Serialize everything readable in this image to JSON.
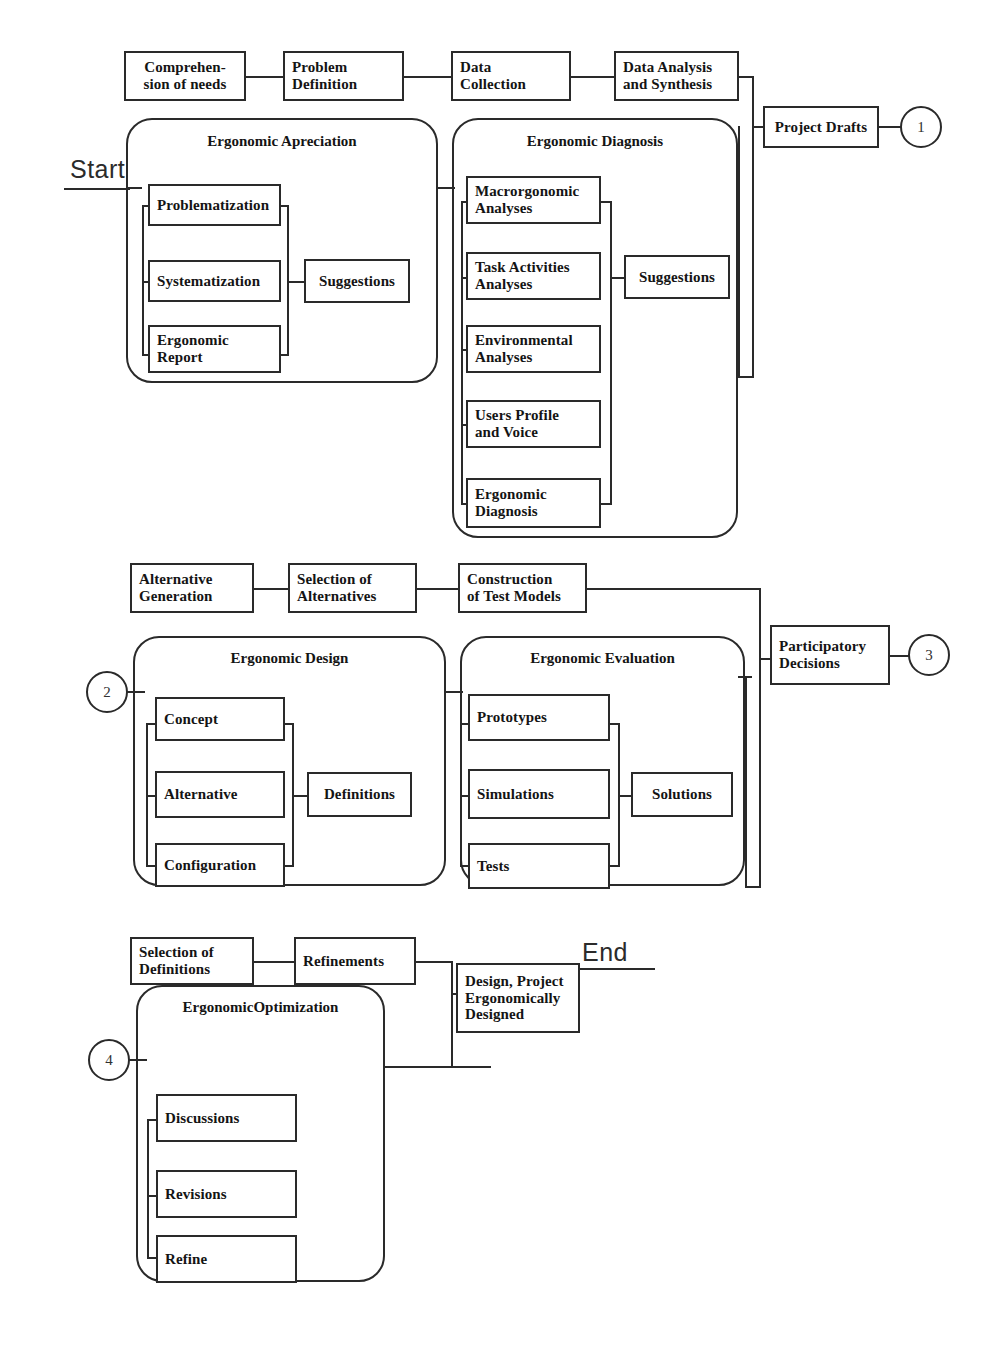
{
  "diagram": {
    "endpoints": {
      "start": "Start",
      "end": "End"
    },
    "connector_nodes": [
      {
        "id": "c1",
        "label": "1"
      },
      {
        "id": "c2",
        "label": "2"
      },
      {
        "id": "c3",
        "label": "3"
      },
      {
        "id": "c4",
        "label": "4"
      }
    ],
    "phase1": {
      "steps": [
        {
          "label": "Comprehen-\nsion of needs"
        },
        {
          "label": "Problem\nDefinition"
        },
        {
          "label": "Data\nCollection"
        },
        {
          "label": "Data Analysis\nand Synthesis"
        }
      ],
      "output": {
        "label": "Project Drafts"
      },
      "panels": [
        {
          "title": "Ergonomic Apreciation",
          "items": [
            {
              "label": "Problematization"
            },
            {
              "label": "Systematization"
            },
            {
              "label": "Ergonomic\nReport"
            }
          ],
          "result": {
            "label": "Suggestions"
          }
        },
        {
          "title": "Ergonomic Diagnosis",
          "items": [
            {
              "label": "Macrorgonomic\nAnalyses"
            },
            {
              "label": "Task Activities\nAnalyses"
            },
            {
              "label": "Environmental\nAnalyses"
            },
            {
              "label": "Users Profile\nand Voice"
            },
            {
              "label": "Ergonomic\nDiagnosis"
            }
          ],
          "result": {
            "label": "Suggestions"
          }
        }
      ]
    },
    "phase2": {
      "steps": [
        {
          "label": "Alternative\nGeneration"
        },
        {
          "label": "Selection of\nAlternatives"
        },
        {
          "label": "Construction\nof Test Models"
        }
      ],
      "output": {
        "label": "Participatory\nDecisions"
      },
      "panels": [
        {
          "title": "Ergonomic Design",
          "items": [
            {
              "label": "Concept"
            },
            {
              "label": "Alternative"
            },
            {
              "label": "Configuration"
            }
          ],
          "result": {
            "label": "Definitions"
          }
        },
        {
          "title": "Ergonomic Evaluation",
          "items": [
            {
              "label": "Prototypes"
            },
            {
              "label": "Simulations"
            },
            {
              "label": "Tests"
            }
          ],
          "result": {
            "label": "Solutions"
          }
        }
      ]
    },
    "phase3": {
      "steps": [
        {
          "label": "Selection of\nDefinitions"
        },
        {
          "label": "Refinements"
        }
      ],
      "output": {
        "label": "Design, Project\nErgonomically\nDesigned"
      },
      "panels": [
        {
          "title": "ErgonomicOptimization",
          "items": [
            {
              "label": "Discussions"
            },
            {
              "label": "Revisions"
            },
            {
              "label": "Refine"
            }
          ]
        }
      ]
    },
    "colors": {
      "stroke": "#2a2a2a",
      "background": "#ffffff",
      "text": "#141414"
    }
  }
}
